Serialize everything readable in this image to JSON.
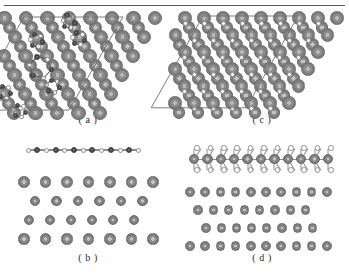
{
  "figure": {
    "background_color": "#fefefe",
    "rule_color": "#5a5a5a",
    "panels": [
      {
        "id": "a",
        "caption": "( a )",
        "view": "top",
        "position": {
          "x": 6,
          "y": 10,
          "w": 164,
          "h": 104
        },
        "description": "Top view of monolayer on substrate with rhombic unit cell",
        "unit_cell": {
          "shown": true,
          "shape": "rhombus",
          "color": "#6f6f6f"
        },
        "atom_colors": {
          "substrate": "#8f8f8f",
          "adatom_dark": "#4a4a4a",
          "adatom_light": "#ffffff"
        }
      },
      {
        "id": "b",
        "caption": "( b )",
        "view": "side",
        "position": {
          "x": 6,
          "y": 140,
          "w": 164,
          "h": 112
        },
        "description": "Side view: single flat chain layer above four substrate layers",
        "layers": 4,
        "atom_colors": {
          "substrate": "#8c8c8c",
          "adatom_dark": "#4a4a4a",
          "adatom_light": "#ffffff"
        }
      },
      {
        "id": "c",
        "caption": "( c )",
        "view": "top",
        "position": {
          "x": 180,
          "y": 10,
          "w": 164,
          "h": 104
        },
        "description": "Top view of trilayer on substrate with rhombic unit cell",
        "unit_cell": {
          "shown": true,
          "shape": "rhombus",
          "color": "#6f6f6f"
        },
        "atom_colors": {
          "substrate": "#8f8f8f",
          "adatom_light": "#ffffff"
        }
      },
      {
        "id": "d",
        "caption": "( d )",
        "view": "side",
        "position": {
          "x": 180,
          "y": 140,
          "w": 164,
          "h": 112
        },
        "description": "Side view: three-atom-thick sandwich layer above four substrate layers",
        "layers": 4,
        "atom_colors": {
          "substrate": "#8c8c8c",
          "adatom_mid": "#8f8f8f",
          "adatom_light": "#ffffff"
        }
      }
    ]
  },
  "chart_data": {
    "type": "diagram",
    "panel_labels": [
      "( a )",
      "( b )",
      "( c )",
      "( d )"
    ],
    "legend": [
      {
        "name": "substrate-atom",
        "color": "#8f8f8f",
        "style": "filled-grey-sphere"
      },
      {
        "name": "adsorbate-dark-atom",
        "color": "#4a4a4a",
        "style": "filled-dark-sphere"
      },
      {
        "name": "adsorbate-open-atom",
        "color": "#ffffff",
        "style": "open-circle"
      }
    ]
  }
}
